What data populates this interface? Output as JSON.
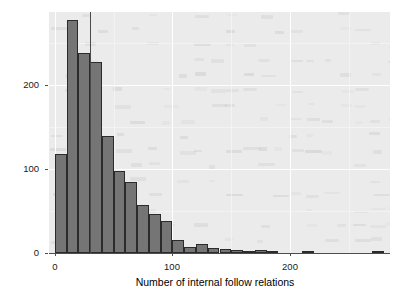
{
  "chart_data": {
    "type": "bar",
    "title": "",
    "subtitle": "",
    "xlabel": "Number of internal follow relations",
    "ylabel": "Frequency",
    "xlim": [
      -5,
      285
    ],
    "ylim": [
      0,
      287
    ],
    "x_ticks": [
      0,
      100,
      200
    ],
    "x_tick_labels": [
      "0",
      "100",
      "200"
    ],
    "y_ticks": [
      0,
      100,
      200
    ],
    "y_tick_labels": [
      "0",
      "100",
      "200"
    ],
    "grid": true,
    "legend": "none",
    "bin_width": 10,
    "categories": [
      "0-10",
      "10-20",
      "20-30",
      "30-40",
      "40-50",
      "50-60",
      "60-70",
      "70-80",
      "80-90",
      "90-100",
      "100-110",
      "110-120",
      "120-130",
      "130-140",
      "140-150",
      "150-160",
      "160-170",
      "170-180",
      "180-190",
      "190-200",
      "200-210",
      "210-220",
      "220-230",
      "230-240",
      "240-250",
      "250-260",
      "260-270",
      "270-280"
    ],
    "bin_starts": [
      0,
      10,
      20,
      30,
      40,
      50,
      60,
      70,
      80,
      90,
      100,
      110,
      120,
      130,
      140,
      150,
      160,
      170,
      180,
      190,
      200,
      210,
      220,
      230,
      240,
      250,
      260,
      270
    ],
    "values": [
      118,
      278,
      238,
      228,
      139,
      98,
      85,
      57,
      47,
      38,
      16,
      7,
      11,
      6,
      5,
      4,
      1,
      3,
      1,
      0,
      0,
      1,
      0,
      0,
      0,
      0,
      0,
      1
    ],
    "annotations": [
      {
        "name": "mean-reference-line",
        "type": "vline",
        "x": 30,
        "color": "#4a4a4a"
      }
    ],
    "colors": {
      "bar_fill": "#757575",
      "bar_outline": "#2b2b2b",
      "panel_background": "#ebebeb",
      "grid_major": "#ffffff",
      "axis_text": "#1a1a1a",
      "axis_title": "#000000",
      "vline": "#4a4a4a"
    }
  }
}
